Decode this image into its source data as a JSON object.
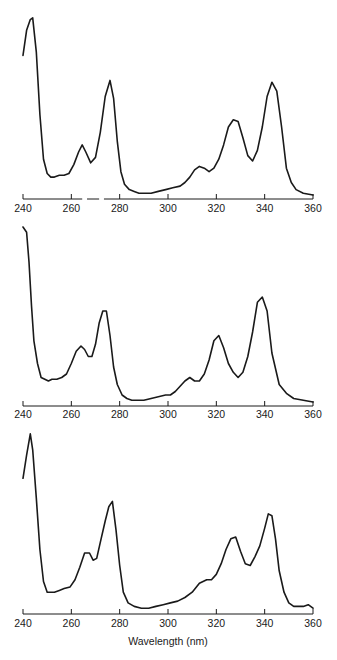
{
  "chart_data": [
    {
      "type": "line",
      "panel": 1,
      "title": "",
      "xlabel": "",
      "ylabel": "",
      "xlim": [
        240,
        360
      ],
      "ylim": [
        0,
        1
      ],
      "grid": false,
      "x_ticks": [
        240,
        260,
        280,
        300,
        320,
        340,
        360
      ],
      "axis_gaps_nm": [
        [
          264.5,
          266.5
        ],
        [
          271.5,
          273.5
        ]
      ],
      "series": [
        {
          "name": "spectrum-1",
          "x": [
            240,
            241.5,
            243,
            244,
            245.5,
            247,
            248.5,
            250,
            251.5,
            253,
            255,
            257,
            259,
            261,
            263,
            264.5,
            266,
            268,
            270,
            272,
            274,
            276,
            277.5,
            279,
            280.5,
            282,
            284,
            286,
            288,
            290,
            293,
            296,
            299,
            302,
            305,
            307,
            309,
            311,
            313,
            315,
            317,
            319,
            321,
            323,
            325,
            327,
            329,
            331,
            333,
            335,
            337,
            339,
            341,
            343,
            345,
            347,
            349,
            351,
            353,
            356,
            360
          ],
          "values": [
            0.78,
            0.92,
            0.98,
            0.99,
            0.8,
            0.45,
            0.2,
            0.12,
            0.1,
            0.1,
            0.11,
            0.11,
            0.12,
            0.17,
            0.24,
            0.28,
            0.24,
            0.18,
            0.21,
            0.35,
            0.55,
            0.64,
            0.54,
            0.3,
            0.13,
            0.06,
            0.03,
            0.02,
            0.01,
            0.01,
            0.01,
            0.02,
            0.03,
            0.04,
            0.05,
            0.07,
            0.1,
            0.14,
            0.16,
            0.15,
            0.13,
            0.15,
            0.2,
            0.28,
            0.38,
            0.42,
            0.41,
            0.32,
            0.22,
            0.19,
            0.25,
            0.38,
            0.55,
            0.63,
            0.58,
            0.38,
            0.15,
            0.07,
            0.03,
            0.01,
            0.0
          ]
        }
      ]
    },
    {
      "type": "line",
      "panel": 2,
      "title": "",
      "xlabel": "",
      "ylabel": "",
      "xlim": [
        240,
        360
      ],
      "ylim": [
        0,
        1
      ],
      "grid": false,
      "x_ticks": [
        240,
        260,
        280,
        300,
        320,
        340,
        360
      ],
      "series": [
        {
          "name": "spectrum-2",
          "x": [
            240,
            241.5,
            242.5,
            243.5,
            244.5,
            246,
            247.5,
            249,
            250.5,
            252,
            254,
            256,
            258,
            260,
            262,
            264,
            265.5,
            267,
            268.5,
            270,
            271.5,
            273,
            274.5,
            276,
            277.5,
            279,
            281,
            283,
            285,
            287,
            290,
            293,
            296,
            299,
            301,
            303,
            305,
            307,
            309,
            311,
            313,
            315,
            317,
            319,
            321,
            323,
            325,
            327,
            329,
            331,
            333,
            335,
            337,
            339,
            341,
            343,
            346,
            349,
            352,
            356,
            360
          ],
          "values": [
            1.0,
            0.97,
            0.8,
            0.55,
            0.35,
            0.22,
            0.14,
            0.13,
            0.12,
            0.13,
            0.13,
            0.14,
            0.16,
            0.22,
            0.29,
            0.32,
            0.3,
            0.26,
            0.26,
            0.33,
            0.45,
            0.52,
            0.52,
            0.38,
            0.2,
            0.1,
            0.04,
            0.02,
            0.01,
            0.01,
            0.01,
            0.02,
            0.03,
            0.04,
            0.04,
            0.06,
            0.09,
            0.12,
            0.14,
            0.12,
            0.12,
            0.16,
            0.24,
            0.35,
            0.38,
            0.31,
            0.22,
            0.17,
            0.14,
            0.17,
            0.26,
            0.4,
            0.57,
            0.6,
            0.52,
            0.28,
            0.1,
            0.05,
            0.02,
            0.01,
            0.0
          ]
        }
      ]
    },
    {
      "type": "line",
      "panel": 3,
      "title": "",
      "xlabel": "Wavelength (nm)",
      "ylabel": "",
      "xlim": [
        240,
        360
      ],
      "ylim": [
        0,
        1
      ],
      "grid": false,
      "x_ticks": [
        240,
        260,
        280,
        300,
        320,
        340,
        360
      ],
      "series": [
        {
          "name": "spectrum-3",
          "x": [
            240,
            241.5,
            243,
            244,
            245.5,
            247,
            248.5,
            250,
            251.5,
            253,
            255,
            257,
            259.5,
            261.5,
            263.5,
            265.5,
            267.5,
            269,
            270.5,
            272,
            274,
            275.5,
            277,
            278.5,
            280,
            281.5,
            283.5,
            286,
            289,
            292,
            295,
            298,
            301,
            304,
            307,
            310,
            313,
            316,
            318,
            320,
            322,
            324,
            326,
            328,
            330,
            332,
            334,
            336,
            338,
            340,
            341.5,
            343,
            344.5,
            346,
            348,
            350,
            352,
            354,
            356,
            358,
            360
          ],
          "values": [
            0.74,
            0.87,
            0.99,
            0.9,
            0.63,
            0.34,
            0.16,
            0.1,
            0.1,
            0.1,
            0.11,
            0.12,
            0.13,
            0.17,
            0.24,
            0.32,
            0.32,
            0.28,
            0.29,
            0.38,
            0.5,
            0.58,
            0.61,
            0.45,
            0.25,
            0.1,
            0.04,
            0.02,
            0.01,
            0.01,
            0.02,
            0.03,
            0.04,
            0.05,
            0.07,
            0.1,
            0.15,
            0.17,
            0.17,
            0.2,
            0.26,
            0.34,
            0.4,
            0.41,
            0.33,
            0.26,
            0.25,
            0.3,
            0.36,
            0.46,
            0.54,
            0.53,
            0.4,
            0.22,
            0.1,
            0.04,
            0.02,
            0.02,
            0.02,
            0.03,
            0.01
          ]
        }
      ]
    }
  ],
  "panels": [
    {
      "x_tick_labels": [
        "240",
        "260",
        "280",
        "300",
        "320",
        "340",
        "360"
      ]
    },
    {
      "x_tick_labels": [
        "240",
        "260",
        "280",
        "300",
        "320",
        "340",
        "360"
      ]
    },
    {
      "x_tick_labels": [
        "240",
        "260",
        "280",
        "300",
        "320",
        "340",
        "360"
      ],
      "xlabel": "Wavelength (nm)"
    }
  ]
}
